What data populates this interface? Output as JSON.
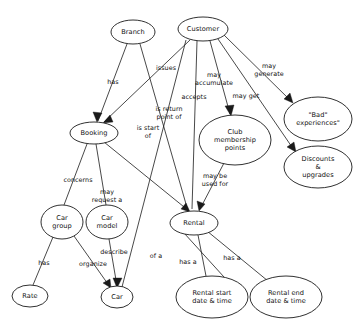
{
  "diagram": {
    "type": "concept-map",
    "colors": {
      "background": "#ffffff",
      "stroke": "#1a1a1a",
      "text": "#111111",
      "node_fill": "#ffffff"
    },
    "nodes": [
      {
        "id": "branch",
        "label": "Branch",
        "cx": 133,
        "cy": 32,
        "rx": 22,
        "ry": 12
      },
      {
        "id": "customer",
        "label": "Customer",
        "cx": 203,
        "cy": 29,
        "rx": 25,
        "ry": 12
      },
      {
        "id": "bad",
        "label": "\"Bad\"\nexperiences\"",
        "cx": 318,
        "cy": 119,
        "rx": 34,
        "ry": 22
      },
      {
        "id": "club",
        "label": "Club\nmembership\npoints",
        "cx": 235,
        "cy": 140,
        "rx": 36,
        "ry": 25
      },
      {
        "id": "discounts",
        "label": "Discounts &\nupgrades",
        "cx": 318,
        "cy": 167,
        "rx": 34,
        "ry": 21
      },
      {
        "id": "booking",
        "label": "Booking",
        "cx": 94,
        "cy": 133,
        "rx": 24,
        "ry": 11
      },
      {
        "id": "cargroup",
        "label": "Car\ngroup",
        "cx": 62,
        "cy": 222,
        "rx": 21,
        "ry": 17
      },
      {
        "id": "carmodel",
        "label": "Car\nmodel",
        "cx": 107,
        "cy": 222,
        "rx": 21,
        "ry": 17
      },
      {
        "id": "rental",
        "label": "Rental",
        "cx": 194,
        "cy": 223,
        "rx": 24,
        "ry": 12
      },
      {
        "id": "rate",
        "label": "Rate",
        "cx": 30,
        "cy": 296,
        "rx": 18,
        "ry": 11
      },
      {
        "id": "car",
        "label": "Car",
        "cx": 117,
        "cy": 297,
        "rx": 16,
        "ry": 11
      },
      {
        "id": "startdate",
        "label": "Rental start\ndate & time",
        "cx": 212,
        "cy": 297,
        "rx": 36,
        "ry": 21
      },
      {
        "id": "enddate",
        "label": "Rental end\ndate & time",
        "cx": 286,
        "cy": 297,
        "rx": 36,
        "ry": 21
      }
    ],
    "edges": [
      {
        "id": "branch-has-booking",
        "label": "has",
        "label_x": 113,
        "label_y": 82,
        "from": "branch",
        "to": "booking",
        "arrow": true
      },
      {
        "id": "branch-is-return-point-of",
        "label": "is return\npoint of",
        "label_x": 169,
        "label_y": 113,
        "from": "branch",
        "to": "rental",
        "arrow": false
      },
      {
        "id": "customer-issues-booking",
        "label": "issues",
        "label_x": 166,
        "label_y": 68,
        "from": "customer",
        "to": "booking",
        "arrow": true
      },
      {
        "id": "customer-is-start-of",
        "label": "is start\nof",
        "label_x": 148,
        "label_y": 132,
        "from": "customer",
        "to": "car",
        "arrow": false
      },
      {
        "id": "customer-accepts",
        "label": "accepts",
        "label_x": 194,
        "label_y": 97,
        "from": "customer",
        "to": "rental",
        "arrow": true
      },
      {
        "id": "customer-may-accumulate",
        "label": "may\naccumulate",
        "label_x": 214,
        "label_y": 79,
        "from": "customer",
        "to": "club",
        "arrow": true
      },
      {
        "id": "customer-may-get",
        "label": "may get",
        "label_x": 246,
        "label_y": 96,
        "from": "customer",
        "to": "discounts",
        "arrow": true
      },
      {
        "id": "customer-may-generate",
        "label": "may\ngenerate",
        "label_x": 269,
        "label_y": 70,
        "from": "customer",
        "to": "bad",
        "arrow": true
      },
      {
        "id": "club-may-be-used-for",
        "label": "may be\nused for",
        "label_x": 215,
        "label_y": 180,
        "from": "club",
        "to": "rental",
        "arrow": true
      },
      {
        "id": "booking-concerns",
        "label": "concerns",
        "label_x": 78,
        "label_y": 180,
        "from": "booking",
        "to": "cargroup",
        "arrow": false
      },
      {
        "id": "booking-may-request-a",
        "label": "may\nrequest a",
        "label_x": 107,
        "label_y": 196,
        "from": "booking",
        "to": "carmodel",
        "arrow": false
      },
      {
        "id": "booking-of-a-rental",
        "label": "of a",
        "label_x": 156,
        "label_y": 256,
        "from": "booking",
        "to": "rental",
        "arrow": true
      },
      {
        "id": "cargroup-has-rate",
        "label": "has",
        "label_x": 44,
        "label_y": 263,
        "from": "cargroup",
        "to": "rate",
        "arrow": false
      },
      {
        "id": "cargroup-organize-car",
        "label": "organize",
        "label_x": 93,
        "label_y": 264,
        "from": "cargroup",
        "to": "car",
        "arrow": true
      },
      {
        "id": "carmodel-describe-car",
        "label": "describe",
        "label_x": 114,
        "label_y": 252,
        "from": "carmodel",
        "to": "car",
        "arrow": true
      },
      {
        "id": "rental-has-a-startdate",
        "label": "has a",
        "label_x": 188,
        "label_y": 262,
        "from": "rental",
        "to": "startdate",
        "arrow": false
      },
      {
        "id": "rental-has-a-enddate",
        "label": "has a",
        "label_x": 232,
        "label_y": 258,
        "from": "rental",
        "to": "enddate",
        "arrow": false
      }
    ]
  }
}
